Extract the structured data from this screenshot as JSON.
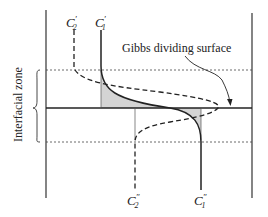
{
  "diagram": {
    "labels": {
      "c2_prime": "C",
      "c2_prime_sub": "2",
      "c2_prime_sup": "′",
      "c1_prime": "C",
      "c1_prime_sub": "1",
      "c1_prime_sup": "′",
      "c2_dprime": "C",
      "c2_dprime_sub": "2",
      "c2_dprime_sup": "″",
      "c1_dprime": "C",
      "c1_dprime_sub": "1",
      "c1_dprime_sup": "″",
      "gibbs": "Gibbs dividing surface",
      "zone": "Interfacial zone"
    },
    "colors": {
      "line": "#222222",
      "shade": "#d4d4d4",
      "background": "#ffffff"
    }
  }
}
